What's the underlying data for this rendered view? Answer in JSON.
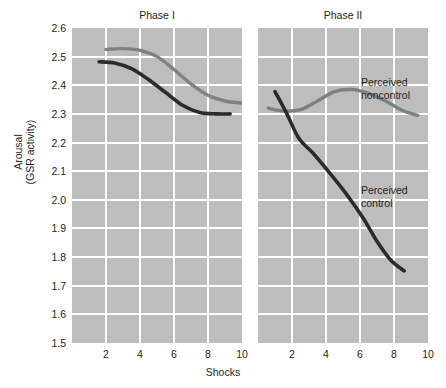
{
  "chart_data": {
    "type": "line",
    "title": "",
    "xlabel": "Shocks",
    "ylabel_line1": "Arousal",
    "ylabel_line2": "(GSR activity)",
    "xlim": [
      0,
      10
    ],
    "ylim": [
      1.5,
      2.6
    ],
    "xticks": [
      2,
      4,
      6,
      8,
      10
    ],
    "yticks": [
      2.6,
      2.5,
      2.4,
      2.3,
      2.2,
      2.1,
      2.0,
      1.9,
      1.8,
      1.7,
      1.6,
      1.5
    ],
    "grid": true,
    "legend_position": "inline-annotation",
    "panels": [
      {
        "title": "Phase I",
        "series": [
          {
            "name": "Perceived noncontrol",
            "color": "#808080",
            "x": [
              2.0,
              3.0,
              4.0,
              5.0,
              6.0,
              7.0,
              8.0,
              9.0,
              10.0
            ],
            "y": [
              2.525,
              2.528,
              2.522,
              2.5,
              2.455,
              2.405,
              2.365,
              2.345,
              2.338
            ]
          },
          {
            "name": "Perceived control",
            "color": "#2b2b2b",
            "x": [
              1.6,
              2.5,
              3.5,
              4.5,
              5.5,
              6.5,
              7.5,
              8.5,
              9.3
            ],
            "y": [
              2.482,
              2.478,
              2.458,
              2.42,
              2.375,
              2.33,
              2.305,
              2.3,
              2.3
            ]
          }
        ]
      },
      {
        "title": "Phase II",
        "series": [
          {
            "name": "Perceived noncontrol",
            "color": "#808080",
            "x": [
              0.6,
              1.5,
              2.5,
              3.5,
              4.5,
              5.5,
              6.5,
              7.5,
              8.5,
              9.4
            ],
            "y": [
              2.32,
              2.31,
              2.315,
              2.345,
              2.378,
              2.385,
              2.372,
              2.345,
              2.312,
              2.295
            ]
          },
          {
            "name": "Perceived control",
            "color": "#2b2b2b",
            "x": [
              1.0,
              1.7,
              2.4,
              3.2,
              4.2,
              5.2,
              6.2,
              7.0,
              7.8,
              8.6
            ],
            "y": [
              2.378,
              2.3,
              2.215,
              2.165,
              2.095,
              2.02,
              1.935,
              1.855,
              1.79,
              1.752
            ]
          }
        ]
      }
    ]
  },
  "annotations": {
    "noncontrol_line1": "Perceived",
    "noncontrol_line2": "noncontrol",
    "control_line1": "Perceived",
    "control_line2": "control"
  },
  "colors": {
    "plot_background": "#bdbdbd",
    "gridline": "#ffffff",
    "page_background": "#ffffff",
    "text": "#231f20",
    "series_noncontrol": "#808080",
    "series_control": "#2b2b2b"
  }
}
